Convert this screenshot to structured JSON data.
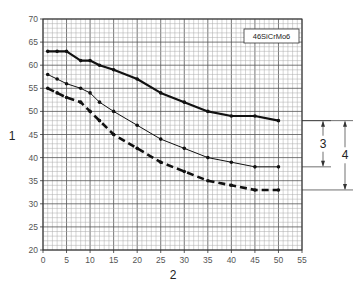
{
  "chart_data": {
    "type": "line",
    "title": "",
    "legend_box": "46SiCrMo6",
    "xlabel": "2",
    "ylabel": "1",
    "xlim": [
      0,
      55
    ],
    "ylim": [
      20,
      70
    ],
    "x_ticks": [
      0,
      5,
      10,
      15,
      20,
      25,
      30,
      35,
      40,
      45,
      50,
      55
    ],
    "y_ticks": [
      20,
      25,
      30,
      35,
      40,
      45,
      50,
      55,
      60,
      65,
      70
    ],
    "grid": true,
    "series": [
      {
        "name": "upper",
        "style": "solid-thick",
        "x": [
          1,
          3,
          5,
          8,
          10,
          12,
          15,
          20,
          25,
          30,
          35,
          40,
          45,
          50
        ],
        "values": [
          63,
          63,
          63,
          61,
          61,
          60,
          59,
          57,
          54,
          52,
          50,
          49,
          49,
          48
        ]
      },
      {
        "name": "middle",
        "style": "solid-thin",
        "x": [
          1,
          3,
          5,
          8,
          10,
          12,
          15,
          20,
          25,
          30,
          35,
          40,
          45,
          50
        ],
        "values": [
          58,
          57,
          56,
          55,
          54,
          52,
          50,
          47,
          44,
          42,
          40,
          39,
          38,
          38
        ]
      },
      {
        "name": "lower",
        "style": "dashed-thick",
        "x": [
          1,
          3,
          5,
          8,
          10,
          12,
          15,
          20,
          25,
          30,
          35,
          40,
          45,
          50
        ],
        "values": [
          55,
          54,
          53,
          52,
          50,
          48,
          45,
          42,
          39,
          37,
          35,
          34,
          33,
          33
        ]
      }
    ],
    "annotations": [
      {
        "label": "3",
        "from": 48,
        "to": 38
      },
      {
        "label": "4",
        "from": 48,
        "to": 33
      }
    ]
  }
}
